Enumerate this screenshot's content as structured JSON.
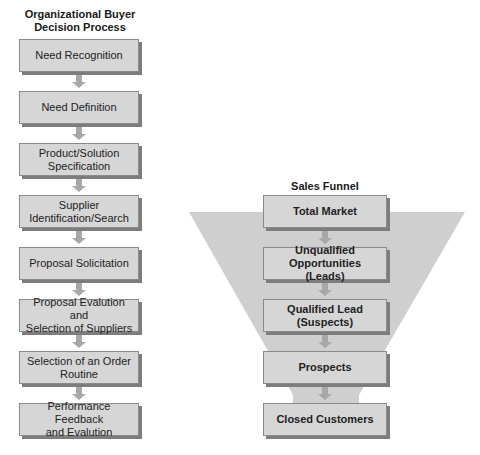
{
  "left_diagram": {
    "title_line1": "Organizational Buyer",
    "title_line2": "Decision Process",
    "steps": [
      {
        "line1": "Need Recognition",
        "line2": ""
      },
      {
        "line1": "Need Definition",
        "line2": ""
      },
      {
        "line1": "Product/Solution",
        "line2": "Specification"
      },
      {
        "line1": "Supplier",
        "line2": "Identification/Search"
      },
      {
        "line1": "Proposal Solicitation",
        "line2": ""
      },
      {
        "line1": "Proposal Evalution and",
        "line2": "Selection of Suppliers"
      },
      {
        "line1": "Selection of an Order",
        "line2": "Routine"
      },
      {
        "line1": "Performance Feedback",
        "line2": "and Evalution"
      }
    ]
  },
  "right_diagram": {
    "title": "Sales Funnel",
    "stages": [
      {
        "line1": "Total Market",
        "line2": ""
      },
      {
        "line1": "Unqualified",
        "line2": "Opportunities (Leads)"
      },
      {
        "line1": "Qualified Lead",
        "line2": "(Suspects)"
      },
      {
        "line1": "Prospects",
        "line2": ""
      },
      {
        "line1": "Closed Customers",
        "line2": ""
      }
    ]
  },
  "colors": {
    "box_fill": "#d6d6d6",
    "box_shadow": "#7d7d7d",
    "funnel_fill": "#cfcfcf",
    "arrow_fill": "#a8a8a8"
  }
}
